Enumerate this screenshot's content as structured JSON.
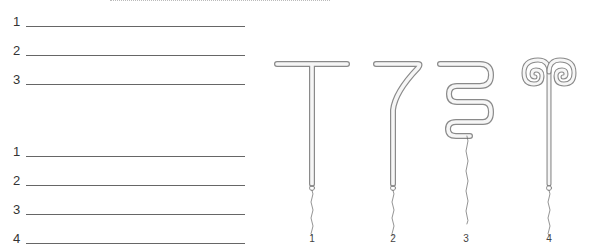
{
  "worksheet": {
    "group_a": {
      "lines": [
        {
          "number": "1",
          "value": ""
        },
        {
          "number": "2",
          "value": ""
        },
        {
          "number": "3",
          "value": ""
        }
      ]
    },
    "group_b": {
      "lines": [
        {
          "number": "1",
          "value": ""
        },
        {
          "number": "2",
          "value": ""
        },
        {
          "number": "3",
          "value": ""
        },
        {
          "number": "4",
          "value": ""
        }
      ]
    }
  },
  "figure": {
    "items": [
      {
        "label": "1",
        "shape": "T-shape"
      },
      {
        "label": "2",
        "shape": "7-shape"
      },
      {
        "label": "3",
        "shape": "S-coil"
      },
      {
        "label": "4",
        "shape": "ram-horn-spiral"
      }
    ],
    "colors": {
      "outline": "#8a8a8a",
      "fill": "#f4f4f4",
      "thread": "#666666"
    }
  }
}
